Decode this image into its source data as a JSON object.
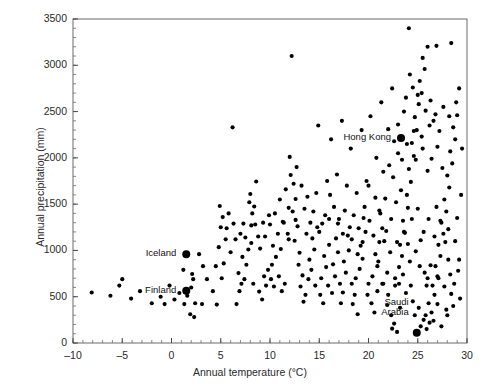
{
  "chart_data": {
    "type": "scatter",
    "title": "",
    "xlabel": "Annual temperature (°C)",
    "ylabel": "Annual precipitation (mm)",
    "xlim": [
      -10,
      30
    ],
    "ylim": [
      0,
      3500
    ],
    "xticks": [
      -10,
      -5,
      0,
      5,
      10,
      15,
      20,
      25,
      30
    ],
    "xtick_labels": [
      "-10",
      "-5",
      "0",
      "5",
      "10",
      "15",
      "20",
      "25",
      "30"
    ],
    "yticks": [
      0,
      500,
      1000,
      1500,
      2000,
      2500,
      3000,
      3500
    ],
    "ytick_labels": [
      "0",
      "500",
      "1000",
      "1500",
      "2000",
      "2500",
      "3000",
      "3500"
    ],
    "x_minor_step": 1,
    "y_minor_step": 100,
    "grid": false,
    "legend": null,
    "marker_color": "#000000",
    "marker_size": 3,
    "highlight_marker_size": 8,
    "annotations": [
      {
        "label": "Hong Kong",
        "x": 23.3,
        "y": 2215,
        "label_align": "right",
        "label_dx": -10,
        "label_dy": 0
      },
      {
        "label": "Iceland",
        "x": 1.5,
        "y": 960,
        "label_align": "right",
        "label_dx": -10,
        "label_dy": 0
      },
      {
        "label": "Finland",
        "x": 1.5,
        "y": 565,
        "label_align": "right",
        "label_dx": -10,
        "label_dy": 0
      },
      {
        "label": "Saudi\nArabia",
        "x": 24.9,
        "y": 110,
        "label_align": "right",
        "label_dx": -8,
        "label_dy": -30
      }
    ],
    "points": [
      [
        -8.1,
        545
      ],
      [
        -5.0,
        690
      ],
      [
        -0.7,
        420
      ],
      [
        1.6,
        510
      ],
      [
        1.6,
        565
      ],
      [
        1.5,
        960
      ],
      [
        2.0,
        600
      ],
      [
        2.2,
        690
      ],
      [
        2.1,
        745
      ],
      [
        1.2,
        790
      ],
      [
        3.1,
        420
      ],
      [
        2.3,
        280
      ],
      [
        4.6,
        415
      ],
      [
        5.1,
        700
      ],
      [
        5.3,
        860
      ],
      [
        4.8,
        1035
      ],
      [
        5.6,
        1240
      ],
      [
        5.2,
        1360
      ],
      [
        6.2,
        2330
      ],
      [
        6.6,
        420
      ],
      [
        6.9,
        560
      ],
      [
        7.1,
        640
      ],
      [
        7.4,
        690
      ],
      [
        6.8,
        755
      ],
      [
        7.6,
        845
      ],
      [
        7.2,
        930
      ],
      [
        7.8,
        1010
      ],
      [
        7.5,
        1140
      ],
      [
        8.1,
        1270
      ],
      [
        8.4,
        1475
      ],
      [
        8.0,
        1610
      ],
      [
        8.6,
        1745
      ],
      [
        8.3,
        640
      ],
      [
        8.9,
        555
      ],
      [
        9.2,
        470
      ],
      [
        9.6,
        620
      ],
      [
        9.4,
        720
      ],
      [
        9.8,
        790
      ],
      [
        10.1,
        690
      ],
      [
        10.4,
        610
      ],
      [
        10.2,
        845
      ],
      [
        10.6,
        930
      ],
      [
        10.9,
        720
      ],
      [
        11.2,
        560
      ],
      [
        11.5,
        640
      ],
      [
        11.1,
        1015
      ],
      [
        11.8,
        1180
      ],
      [
        11.4,
        1300
      ],
      [
        11.9,
        1460
      ],
      [
        12.2,
        3100
      ],
      [
        12.1,
        1815
      ],
      [
        12.4,
        1720
      ],
      [
        12.6,
        1555
      ],
      [
        12.3,
        1420
      ],
      [
        12.8,
        1260
      ],
      [
        12.5,
        1105
      ],
      [
        13.0,
        975
      ],
      [
        12.9,
        845
      ],
      [
        13.3,
        730
      ],
      [
        13.1,
        610
      ],
      [
        13.6,
        520
      ],
      [
        13.4,
        445
      ],
      [
        13.9,
        690
      ],
      [
        14.2,
        790
      ],
      [
        14.0,
        900
      ],
      [
        14.5,
        1010
      ],
      [
        14.3,
        1130
      ],
      [
        14.8,
        1250
      ],
      [
        14.6,
        620
      ],
      [
        15.1,
        520
      ],
      [
        15.4,
        430
      ],
      [
        15.2,
        700
      ],
      [
        15.7,
        820
      ],
      [
        15.5,
        940
      ],
      [
        16.0,
        1060
      ],
      [
        15.9,
        620
      ],
      [
        16.3,
        540
      ],
      [
        16.6,
        720
      ],
      [
        16.4,
        850
      ],
      [
        16.9,
        980
      ],
      [
        16.7,
        1130
      ],
      [
        17.1,
        640
      ],
      [
        17.4,
        545
      ],
      [
        17.2,
        430
      ],
      [
        17.7,
        760
      ],
      [
        17.5,
        880
      ],
      [
        18.0,
        1000
      ],
      [
        17.9,
        1160
      ],
      [
        18.3,
        640
      ],
      [
        18.6,
        520
      ],
      [
        18.4,
        420
      ],
      [
        18.9,
        310
      ],
      [
        18.7,
        700
      ],
      [
        19.1,
        800
      ],
      [
        19.4,
        910
      ],
      [
        19.2,
        1050
      ],
      [
        19.7,
        1200
      ],
      [
        19.5,
        1350
      ],
      [
        20.0,
        640
      ],
      [
        19.9,
        520
      ],
      [
        20.3,
        430
      ],
      [
        20.6,
        330
      ],
      [
        20.4,
        720
      ],
      [
        20.9,
        830
      ],
      [
        20.7,
        960
      ],
      [
        21.1,
        1090
      ],
      [
        21.4,
        1240
      ],
      [
        21.2,
        1400
      ],
      [
        21.7,
        1560
      ],
      [
        21.5,
        640
      ],
      [
        22.0,
        520
      ],
      [
        21.9,
        410
      ],
      [
        22.3,
        300
      ],
      [
        22.6,
        210
      ],
      [
        22.4,
        155
      ],
      [
        22.9,
        120
      ],
      [
        22.7,
        700
      ],
      [
        23.1,
        820
      ],
      [
        23.4,
        940
      ],
      [
        23.2,
        1060
      ],
      [
        23.7,
        1190
      ],
      [
        23.5,
        1320
      ],
      [
        24.0,
        1460
      ],
      [
        23.9,
        1600
      ],
      [
        24.3,
        1740
      ],
      [
        24.1,
        1880
      ],
      [
        24.6,
        2020
      ],
      [
        24.4,
        2160
      ],
      [
        23.3,
        2215
      ],
      [
        24.9,
        2300
      ],
      [
        24.7,
        2440
      ],
      [
        25.1,
        2580
      ],
      [
        25.4,
        2700
      ],
      [
        25.2,
        2830
      ],
      [
        25.7,
        2960
      ],
      [
        25.5,
        3080
      ],
      [
        26.0,
        3200
      ],
      [
        24.1,
        3400
      ],
      [
        24.9,
        110
      ],
      [
        25.3,
        180
      ],
      [
        25.6,
        250
      ],
      [
        25.9,
        150
      ],
      [
        26.2,
        220
      ],
      [
        26.4,
        330
      ],
      [
        26.1,
        430
      ],
      [
        26.7,
        520
      ],
      [
        26.5,
        620
      ],
      [
        27.0,
        720
      ],
      [
        26.8,
        830
      ],
      [
        27.3,
        940
      ],
      [
        27.1,
        1060
      ],
      [
        27.6,
        1180
      ],
      [
        27.4,
        1300
      ],
      [
        27.9,
        1420
      ],
      [
        27.7,
        1550
      ],
      [
        28.2,
        1680
      ],
      [
        28.0,
        1810
      ],
      [
        28.5,
        1940
      ],
      [
        28.3,
        2070
      ],
      [
        28.8,
        2200
      ],
      [
        28.6,
        2330
      ],
      [
        29.0,
        2460
      ],
      [
        28.9,
        2600
      ],
      [
        29.2,
        2750
      ],
      [
        28.4,
        3240
      ],
      [
        26.9,
        3210
      ],
      [
        26.3,
        2620
      ],
      [
        25.8,
        2510
      ],
      [
        26.6,
        2400
      ],
      [
        27.2,
        2290
      ],
      [
        25.0,
        2680
      ],
      [
        24.5,
        2760
      ],
      [
        24.2,
        2900
      ],
      [
        23.8,
        2650
      ],
      [
        23.6,
        2500
      ],
      [
        23.0,
        2360
      ],
      [
        24.8,
        1980
      ],
      [
        25.5,
        2100
      ],
      [
        26.0,
        1860
      ],
      [
        26.4,
        1990
      ],
      [
        27.0,
        2120
      ],
      [
        27.5,
        1890
      ],
      [
        22.8,
        1520
      ],
      [
        23.3,
        1650
      ],
      [
        22.5,
        1790
      ],
      [
        22.1,
        1920
      ],
      [
        23.0,
        2050
      ],
      [
        24.4,
        1340
      ],
      [
        25.0,
        1450
      ],
      [
        25.6,
        1200
      ],
      [
        26.1,
        1340
      ],
      [
        26.9,
        1470
      ],
      [
        27.8,
        1090
      ],
      [
        28.1,
        1230
      ],
      [
        22.2,
        980
      ],
      [
        22.9,
        1090
      ],
      [
        23.6,
        1200
      ],
      [
        24.2,
        880
      ],
      [
        24.8,
        990
      ],
      [
        25.3,
        1110
      ],
      [
        26.3,
        840
      ],
      [
        27.1,
        700
      ],
      [
        27.7,
        610
      ],
      [
        28.4,
        530
      ],
      [
        28.7,
        640
      ],
      [
        29.1,
        780
      ],
      [
        23.1,
        640
      ],
      [
        23.8,
        540
      ],
      [
        24.5,
        450
      ],
      [
        25.1,
        380
      ],
      [
        25.8,
        300
      ],
      [
        26.6,
        240
      ],
      [
        27.4,
        180
      ],
      [
        28.0,
        300
      ],
      [
        28.6,
        400
      ],
      [
        29.3,
        480
      ],
      [
        21.6,
        1100
      ],
      [
        21.0,
        880
      ],
      [
        20.5,
        1160
      ],
      [
        20.1,
        1320
      ],
      [
        19.6,
        1470
      ],
      [
        19.0,
        1240
      ],
      [
        18.5,
        1380
      ],
      [
        18.1,
        1250
      ],
      [
        17.6,
        1430
      ],
      [
        17.0,
        1340
      ],
      [
        16.5,
        1470
      ],
      [
        16.1,
        1600
      ],
      [
        15.6,
        1380
      ],
      [
        15.0,
        1200
      ],
      [
        14.4,
        1420
      ],
      [
        13.8,
        1580
      ],
      [
        13.2,
        1700
      ],
      [
        12.7,
        1900
      ],
      [
        12.0,
        2010
      ],
      [
        11.6,
        1660
      ],
      [
        11.0,
        1550
      ],
      [
        10.5,
        1400
      ],
      [
        10.0,
        1280
      ],
      [
        9.5,
        1150
      ],
      [
        9.0,
        1020
      ],
      [
        8.5,
        1280
      ],
      [
        8.2,
        1400
      ],
      [
        7.9,
        1520
      ],
      [
        7.3,
        1290
      ],
      [
        6.5,
        1120
      ],
      [
        6.0,
        980
      ],
      [
        5.5,
        1120
      ],
      [
        5.0,
        1250
      ],
      [
        4.5,
        830
      ],
      [
        4.2,
        560
      ],
      [
        3.6,
        690
      ],
      [
        3.2,
        830
      ],
      [
        2.8,
        960
      ],
      [
        2.4,
        430
      ],
      [
        1.9,
        310
      ],
      [
        1.3,
        420
      ],
      [
        0.8,
        540
      ],
      [
        0.3,
        470
      ],
      [
        -0.2,
        620
      ],
      [
        -1.1,
        500
      ],
      [
        -2.0,
        430
      ],
      [
        -3.2,
        560
      ],
      [
        -4.1,
        480
      ],
      [
        -5.3,
        620
      ],
      [
        -6.2,
        510
      ],
      [
        14.9,
        2350
      ],
      [
        16.2,
        2200
      ],
      [
        17.3,
        2400
      ],
      [
        18.2,
        2100
      ],
      [
        19.3,
        2300
      ],
      [
        20.2,
        2450
      ],
      [
        21.3,
        2600
      ],
      [
        22.4,
        2750
      ],
      [
        20.8,
        2000
      ],
      [
        19.8,
        1750
      ],
      [
        18.8,
        1620
      ],
      [
        17.8,
        1700
      ],
      [
        16.8,
        1820
      ],
      [
        15.8,
        1750
      ],
      [
        14.7,
        1620
      ],
      [
        13.5,
        1450
      ],
      [
        29.4,
        1600
      ],
      [
        29.0,
        1350
      ],
      [
        28.8,
        1100
      ],
      [
        29.2,
        900
      ],
      [
        29.5,
        2100
      ],
      [
        28.2,
        2450
      ],
      [
        27.6,
        2550
      ],
      [
        26.8,
        2470
      ],
      [
        26.2,
        2350
      ],
      [
        25.4,
        2230
      ],
      [
        24.6,
        2290
      ],
      [
        23.9,
        2150
      ],
      [
        23.4,
        1980
      ],
      [
        22.6,
        2180
      ],
      [
        22.0,
        2310
      ],
      [
        21.5,
        1850
      ],
      [
        24.0,
        1070
      ],
      [
        25.2,
        830
      ],
      [
        26.0,
        700
      ],
      [
        26.7,
        1150
      ],
      [
        27.3,
        1320
      ],
      [
        28.1,
        900
      ],
      [
        22.3,
        1340
      ],
      [
        21.8,
        1210
      ],
      [
        21.1,
        1430
      ],
      [
        20.7,
        1570
      ],
      [
        20.0,
        1700
      ],
      [
        19.4,
        1090
      ],
      [
        18.9,
        960
      ],
      [
        18.3,
        1120
      ],
      [
        17.4,
        1180
      ],
      [
        16.9,
        1290
      ],
      [
        16.0,
        1340
      ],
      [
        15.3,
        1290
      ],
      [
        14.1,
        1300
      ],
      [
        13.7,
        1180
      ],
      [
        12.6,
        1330
      ],
      [
        11.9,
        1120
      ],
      [
        11.3,
        1310
      ],
      [
        10.8,
        1180
      ],
      [
        10.3,
        1050
      ],
      [
        9.9,
        1380
      ],
      [
        9.3,
        1300
      ],
      [
        8.8,
        1150
      ],
      [
        8.1,
        1080
      ],
      [
        7.0,
        1180
      ],
      [
        6.3,
        1290
      ],
      [
        5.8,
        1400
      ],
      [
        4.9,
        1480
      ],
      [
        24.3,
        620
      ],
      [
        25.7,
        760
      ],
      [
        23.5,
        740
      ],
      [
        22.7,
        620
      ],
      [
        23.2,
        380
      ],
      [
        24.7,
        300
      ],
      [
        25.9,
        620
      ],
      [
        27.0,
        420
      ],
      [
        27.9,
        360
      ],
      [
        28.3,
        740
      ],
      [
        21.9,
        760
      ],
      [
        21.4,
        640
      ],
      [
        20.9,
        560
      ]
    ]
  }
}
